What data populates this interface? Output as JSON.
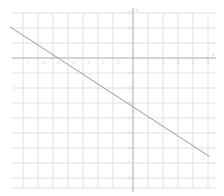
{
  "chart_data": {
    "type": "line",
    "title": "",
    "subtitle": "",
    "xlabel": "x",
    "ylabel": "y",
    "grid": true,
    "legend": null,
    "xlim": [
      -7.5,
      5.5
    ],
    "ylim": [
      -8.8,
      3.0
    ],
    "x_ticks": [
      -7,
      -6,
      -5,
      -4,
      -3,
      -2,
      -1,
      1,
      2,
      3,
      4,
      5
    ],
    "y_ticks": [
      3,
      2,
      1,
      -1,
      -2,
      -3,
      -4,
      -5,
      -6,
      -7,
      -8
    ],
    "x_tick_labels": [
      "-7",
      "-6",
      "-5",
      "-4",
      "-3",
      "-2",
      "-1",
      "1",
      "2",
      "3",
      "4",
      "5"
    ],
    "y_tick_labels": [
      "3",
      "2",
      "1",
      "-1",
      "-2",
      "-3",
      "-4",
      "-5",
      "-6",
      "-7",
      "-8"
    ],
    "series": [
      {
        "name": "line",
        "slope": -0.65,
        "intercept": -3.25,
        "x_intercept": -5,
        "y_intercept": -3.25,
        "x": [
          -8.2,
          5.1
        ],
        "y": [
          2.08,
          -6.57
        ],
        "color": "#8d8d8d"
      }
    ],
    "colors": {
      "grid": "#c9cdd6",
      "axis": "#9aa0ab",
      "line": "#8d8d8d",
      "tick_text": "#b9bcc4",
      "background": "#ffffff"
    }
  }
}
